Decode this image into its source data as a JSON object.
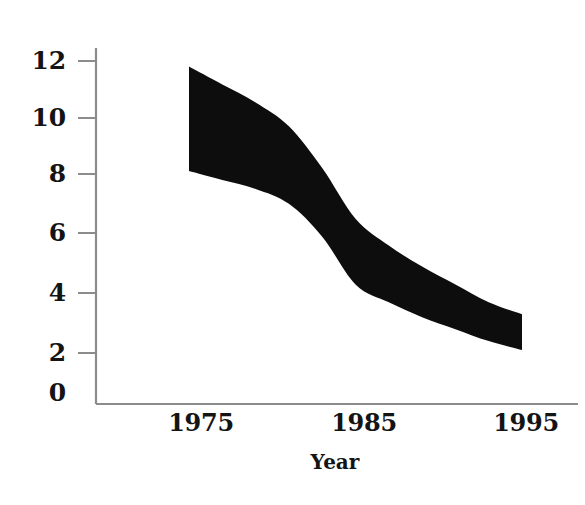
{
  "chart_data": {
    "type": "area",
    "title": "",
    "subtitle": "",
    "xlabel": "Year",
    "ylabel": "",
    "xlim": [
      1972,
      1996.5
    ],
    "ylim": [
      0,
      13
    ],
    "grid": false,
    "legend": null,
    "series_style": "shaded band between upper and lower bound",
    "x": [
      1975,
      1977,
      1979,
      1981,
      1983,
      1985,
      1987,
      1989,
      1991,
      1993,
      1995
    ],
    "series": [
      {
        "name": "Upper bound",
        "values": [
          11.6,
          11.0,
          10.4,
          9.6,
          8.2,
          6.5,
          5.6,
          4.9,
          4.3,
          3.7,
          3.3
        ]
      },
      {
        "name": "Lower bound",
        "values": [
          8.1,
          7.8,
          7.5,
          7.0,
          5.9,
          4.3,
          3.7,
          3.2,
          2.8,
          2.4,
          2.1
        ]
      }
    ],
    "x_ticks": [
      1975,
      1985,
      1995
    ],
    "x_tick_labels": [
      "1975",
      "1985",
      "1995"
    ],
    "y_ticks": [
      0,
      2,
      4,
      6,
      8,
      10,
      12
    ],
    "y_tick_labels": [
      "0",
      "2",
      "4",
      "6",
      "8",
      "10",
      "12"
    ],
    "band_color": "#0d0d0d",
    "axis_color": "#8c8c8c",
    "background_color": "#ffffff"
  },
  "axes": {
    "y_labels": [
      {
        "text": "12",
        "value": 12
      },
      {
        "text": "10",
        "value": 10
      },
      {
        "text": "8",
        "value": 8
      },
      {
        "text": "6",
        "value": 6
      },
      {
        "text": "4",
        "value": 4
      },
      {
        "text": "2",
        "value": 2
      },
      {
        "text": "0",
        "value": 0
      }
    ],
    "x_labels": [
      {
        "text": "1975",
        "value": 1975
      },
      {
        "text": "1985",
        "value": 1985
      },
      {
        "text": "1995",
        "value": 1995
      }
    ],
    "x_axis_title": "Year"
  }
}
